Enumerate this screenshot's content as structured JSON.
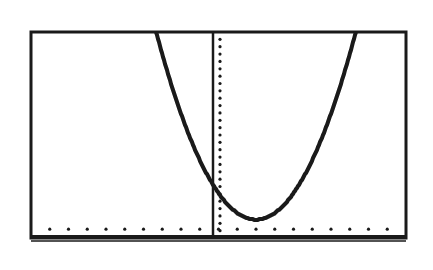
{
  "screen": {
    "background": "#ffffff",
    "ink": "#1a1a1a"
  },
  "chart_data": {
    "type": "line",
    "title": "",
    "xlabel": "",
    "ylabel": "",
    "xlim": [
      -10,
      10
    ],
    "ylim": [
      -1,
      27
    ],
    "x_tick_step": 1,
    "y_tick_step": 1,
    "grid": false,
    "legend": null,
    "series": [
      {
        "name": "parabola",
        "vertex": [
          2,
          1.5
        ],
        "a": 0.9,
        "x": [
          -2.1,
          -1,
          0,
          1,
          2,
          3,
          4,
          5,
          6.2
        ],
        "y": [
          26.5,
          13,
          5,
          2.2,
          1.5,
          2.2,
          5,
          13,
          26.5
        ]
      }
    ]
  }
}
